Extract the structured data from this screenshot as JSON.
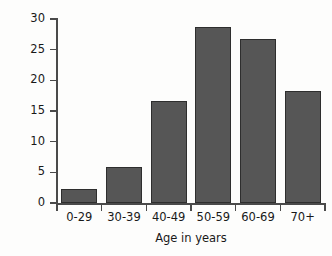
{
  "chart_data": {
    "type": "bar",
    "title": "",
    "subtitle": "",
    "xlabel": "Age in years",
    "ylabel": "Percent of total",
    "categories": [
      "0-29",
      "30-39",
      "40-49",
      "50-59",
      "60-69",
      "70+"
    ],
    "values": [
      2.3,
      5.9,
      16.7,
      28.7,
      26.7,
      18.3
    ],
    "ylim": [
      0,
      30
    ],
    "ytick_labels": [
      "0",
      "5",
      "10",
      "15",
      "20",
      "25",
      "30"
    ],
    "ytick_values": [
      0,
      5,
      10,
      15,
      20,
      25,
      30
    ],
    "grid": false,
    "legend": null,
    "legend_position": "none",
    "annotations": [],
    "series": [
      {
        "name": "Percent of total",
        "values": [
          2.3,
          5.9,
          16.7,
          28.7,
          26.7,
          18.3
        ]
      }
    ],
    "colors": {
      "bar_fill": "#565656",
      "bar_edge": "#2e2e2e",
      "axis": "#4a4a4a",
      "text": "#191919",
      "background": "#fdfdfc"
    }
  }
}
